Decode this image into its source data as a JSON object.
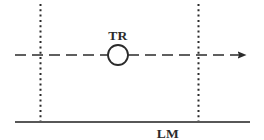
{
  "diagram": {
    "background_color": "#ffffff",
    "stroke_color": "#2b2b2b",
    "canvas": {
      "width": 264,
      "height": 140
    },
    "labels": {
      "vehicle": "TR",
      "lane_marking": "LM"
    },
    "elements": {
      "trajectory_arrow": {
        "name": "trajectory-dashed-arrow",
        "style": "dashed",
        "y": 55,
        "x_start": 15,
        "x_end": 255,
        "dash_pattern": "11 6",
        "arrowhead": "solid-triangle-right"
      },
      "vehicle_circle": {
        "name": "vehicle-circle",
        "cx": 118,
        "cy": 55,
        "r": 10,
        "fill": "#ffffff"
      },
      "left_boundary": {
        "name": "left-dotted-boundary",
        "x": 40.5,
        "y_start": 4,
        "y_end": 122,
        "style": "dotted"
      },
      "right_boundary": {
        "name": "right-dotted-boundary",
        "x": 198.5,
        "y_start": 4,
        "y_end": 122,
        "style": "dotted"
      },
      "lane_marking_line": {
        "name": "lane-marking-line",
        "y": 122,
        "x_start": 15,
        "x_end": 250,
        "style": "solid"
      }
    },
    "label_positions": {
      "vehicle": {
        "x": 118,
        "y": 40
      },
      "lane_marking": {
        "x": 168,
        "y": 138
      }
    }
  }
}
